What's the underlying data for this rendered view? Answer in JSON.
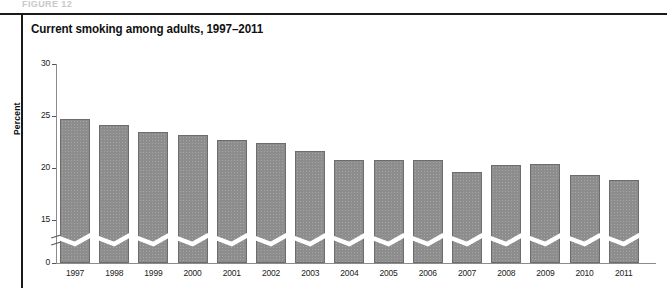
{
  "figure": {
    "cut_off_header": "FIGURE 12",
    "title": "Current smoking among adults, 1997–2011"
  },
  "chart_data": {
    "type": "bar",
    "title": "Current smoking among adults, 1997–2011",
    "xlabel": "",
    "ylabel": "Percent",
    "categories": [
      "1997",
      "1998",
      "1999",
      "2000",
      "2001",
      "2002",
      "2003",
      "2004",
      "2005",
      "2006",
      "2007",
      "2008",
      "2009",
      "2010",
      "2011"
    ],
    "values": [
      24.7,
      24.1,
      23.5,
      23.2,
      22.7,
      22.4,
      21.6,
      20.8,
      20.8,
      20.8,
      19.6,
      20.3,
      20.4,
      19.3,
      18.8
    ],
    "ylim": [
      0,
      30
    ],
    "yticks": [
      0,
      15,
      20,
      25,
      30
    ],
    "ytick_labels": [
      "0",
      "15",
      "20",
      "25",
      "30"
    ],
    "axis_break": true,
    "axis_break_note": "y-axis has a break between 0 and 15; bars are interrupted by a white zig-zag band",
    "grid": false,
    "legend": null,
    "bar_color": "#8d8d8d",
    "bar_edge_color": "#6d6d6d"
  }
}
